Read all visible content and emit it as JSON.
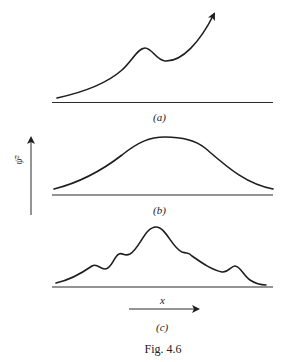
{
  "figure": {
    "caption": "Fig. 4.6",
    "x_axis_label": "x",
    "y_axis_label": "ψ̄²",
    "panels": [
      {
        "id": "a",
        "label": "(a)",
        "description": "rising curve with local bump, continuing upward with arrow"
      },
      {
        "id": "b",
        "label": "(b)",
        "description": "smooth broad bell-shaped curve"
      },
      {
        "id": "c",
        "label": "(c)",
        "description": "peaked curve with several small bumps"
      }
    ]
  },
  "colors": {
    "ink": "#1e1e1e",
    "background": "#ffffff"
  }
}
